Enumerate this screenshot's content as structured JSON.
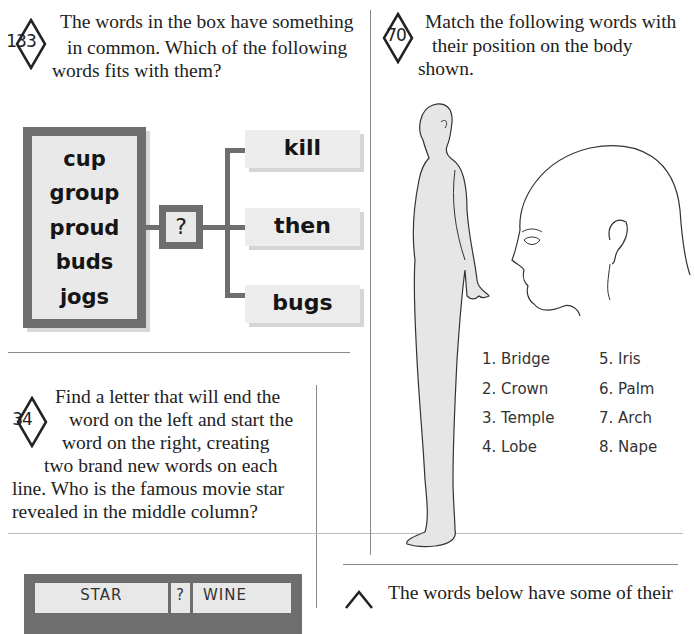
{
  "puzzle_133": {
    "number": "133",
    "text_lines": [
      "The words in the box have something",
      "in common. Which of the following",
      "words fits with them?"
    ],
    "box_words": [
      "cup",
      "group",
      "proud",
      "buds",
      "jogs"
    ],
    "question_mark": "?",
    "options": [
      "kill",
      "then",
      "bugs"
    ]
  },
  "puzzle_70": {
    "number": "70",
    "text_lines": [
      "Match the following words with",
      "their position on the body",
      "shown."
    ],
    "labels_left": [
      "1. Bridge",
      "2. Crown",
      "3. Temple",
      "4. Lobe"
    ],
    "labels_right": [
      "5. Iris",
      "6. Palm",
      "7. Arch",
      "8. Nape"
    ]
  },
  "puzzle_34": {
    "number": "34",
    "text_lines": [
      "Find a letter that will end the",
      "word on the left and start the",
      "word on the right, creating",
      "two brand new words on each",
      "line. Who is the famous movie star",
      "revealed in the middle column?"
    ],
    "grid_rows": [
      {
        "left": "STAR",
        "middle": "?",
        "right": "WINE"
      }
    ]
  },
  "puzzle_next": {
    "text_lines": [
      "The words below have some of their"
    ]
  },
  "colors": {
    "box_border": "#6e6e6e",
    "box_fill": "#e9e9e9",
    "figure_fill": "#e6e6e6",
    "rule": "#8a8a8a"
  }
}
